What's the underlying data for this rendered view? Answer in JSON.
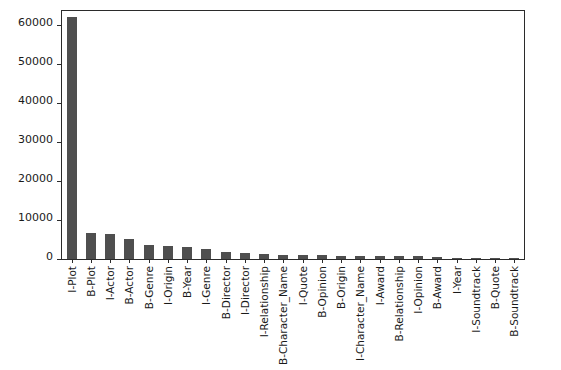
{
  "chart_data": {
    "type": "bar",
    "title": "",
    "xlabel": "",
    "ylabel": "",
    "grid": false,
    "legend": null,
    "ylim": [
      0,
      63500
    ],
    "yticks": [
      0,
      10000,
      20000,
      30000,
      40000,
      50000,
      60000
    ],
    "ytick_labels": [
      "0",
      "10000",
      "20000",
      "30000",
      "40000",
      "50000",
      "60000"
    ],
    "bar_color": "#4f4f4f",
    "categories": [
      "I-Plot",
      "B-Plot",
      "I-Actor",
      "B-Actor",
      "B-Genre",
      "I-Origin",
      "B-Year",
      "I-Genre",
      "B-Director",
      "I-Director",
      "I-Relationship",
      "B-Character_Name",
      "I-Quote",
      "B-Opinion",
      "B-Origin",
      "I-Character_Name",
      "I-Award",
      "B-Relationship",
      "I-Opinion",
      "B-Award",
      "I-Year",
      "I-Soundtrack",
      "B-Quote",
      "B-Soundtrack"
    ],
    "values": [
      62000,
      6550,
      6450,
      5200,
      3500,
      3450,
      3200,
      2550,
      1900,
      1600,
      1250,
      1150,
      1050,
      950,
      900,
      800,
      750,
      700,
      650,
      600,
      330,
      280,
      240,
      90
    ]
  },
  "figure": {
    "background": "#ffffff",
    "axis_color": "#2b2b2b"
  }
}
